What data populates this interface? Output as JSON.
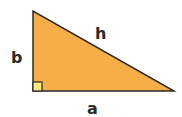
{
  "diagram": {
    "type": "right-triangle",
    "colors": {
      "fill": "#F6AE48",
      "stroke": "#2a2a2a",
      "right_angle_fill": "#FCEB7A",
      "background": "#ffffff"
    },
    "labels": {
      "vertical_leg": "b",
      "hypotenuse": "h",
      "horizontal_leg": "a"
    },
    "vertices": [
      [
        33,
        11
      ],
      [
        33,
        91
      ],
      [
        174,
        91
      ]
    ]
  }
}
